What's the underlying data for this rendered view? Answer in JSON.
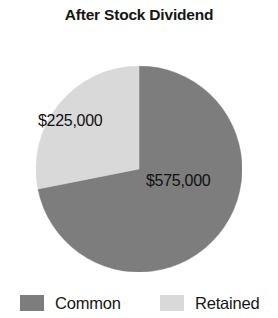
{
  "chart": {
    "title": "After Stock Dividend"
  },
  "labels": {
    "retained_value": "$225,000",
    "common_value": "$575,000"
  },
  "legend": {
    "items": [
      {
        "label": "Common",
        "color": "#7d7d7d",
        "swatch_name": "legend-swatch-common"
      },
      {
        "label": "Retained",
        "color": "#d9d9d9",
        "swatch_name": "legend-swatch-retained"
      }
    ]
  },
  "chart_data": {
    "type": "pie",
    "title": "After Stock Dividend",
    "xlabel": "",
    "ylabel": "",
    "legend_position": "bottom",
    "grid": false,
    "start_angle_deg": 0,
    "direction": "clockwise",
    "total": 800000,
    "categories": [
      "Common",
      "Retained"
    ],
    "values": [
      575000,
      225000
    ],
    "value_labels": [
      "$575,000",
      "$225,000"
    ],
    "percentages": [
      71.875,
      28.125
    ],
    "colors": [
      "#7d7d7d",
      "#d9d9d9"
    ],
    "slices": [
      {
        "name": "Common",
        "value": 575000,
        "label": "$575,000",
        "percent": 71.875,
        "color": "#7d7d7d",
        "start_angle_deg": 0,
        "end_angle_deg": 258.75
      },
      {
        "name": "Retained",
        "value": 225000,
        "label": "$225,000",
        "percent": 28.125,
        "color": "#d9d9d9",
        "start_angle_deg": 258.75,
        "end_angle_deg": 360
      }
    ]
  }
}
